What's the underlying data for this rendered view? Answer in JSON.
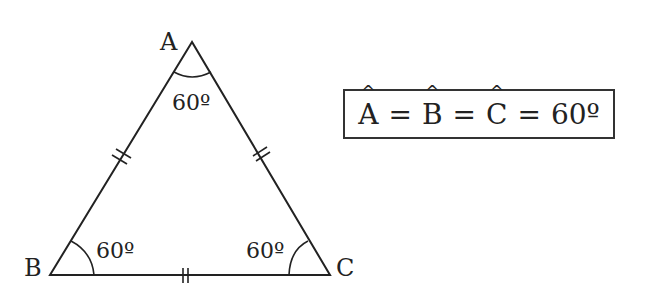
{
  "diagram": {
    "vertices": {
      "A": {
        "label": "A",
        "x": 192,
        "y": 42
      },
      "B": {
        "label": "B",
        "x": 50,
        "y": 275
      },
      "C": {
        "label": "C",
        "x": 330,
        "y": 275
      }
    },
    "angles": {
      "A": {
        "label": "60º"
      },
      "B": {
        "label": "60º"
      },
      "C": {
        "label": "60º"
      }
    },
    "equal_side_marks": "double tick (||) on each side",
    "line_color": "#222222"
  },
  "formula": {
    "parts": [
      "A",
      "=",
      "B",
      "=",
      "C",
      "=",
      "60º"
    ]
  }
}
